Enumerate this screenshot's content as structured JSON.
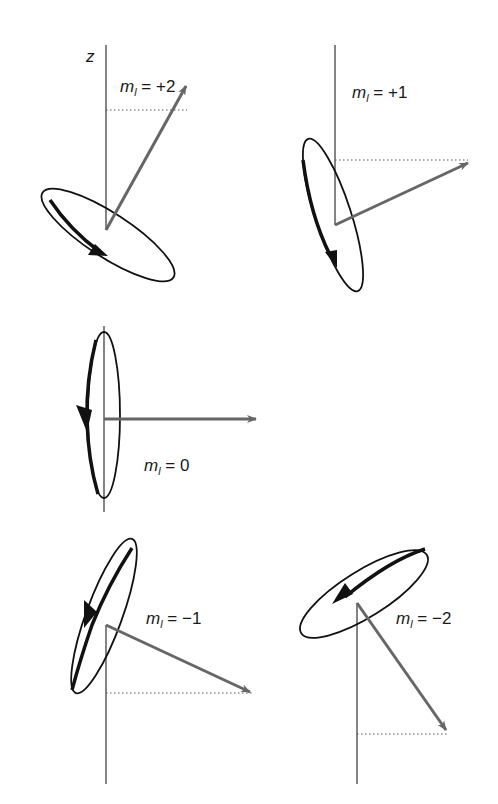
{
  "diagram": {
    "type": "orbital angular momentum vector model",
    "axis_label": "z",
    "colors": {
      "axis": "#333333",
      "vector": "#666666",
      "orbit": "#111111",
      "projection": "#555555"
    },
    "states": [
      {
        "ml": "+2",
        "label_var": "m",
        "label_sub": "l",
        "label_rest": " = +2",
        "vector_direction": "up-right, steep"
      },
      {
        "ml": "+1",
        "label_var": "m",
        "label_sub": "l",
        "label_rest": " = +1",
        "vector_direction": "up-right, shallow"
      },
      {
        "ml": "0",
        "label_var": "m",
        "label_sub": "l",
        "label_rest": " = 0",
        "vector_direction": "horizontal right"
      },
      {
        "ml": "-1",
        "label_var": "m",
        "label_sub": "l",
        "label_rest": " = −1",
        "vector_direction": "down-right, shallow"
      },
      {
        "ml": "-2",
        "label_var": "m",
        "label_sub": "l",
        "label_rest": " = −2",
        "vector_direction": "down-right, steep"
      }
    ]
  }
}
